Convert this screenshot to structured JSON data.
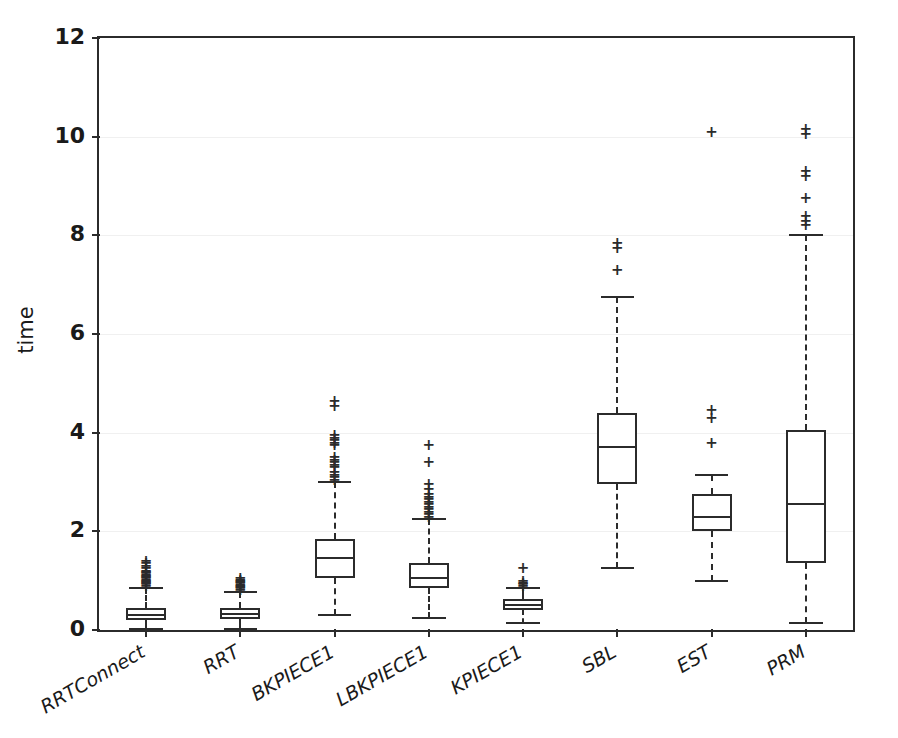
{
  "chart_data": {
    "type": "box",
    "title": "",
    "xlabel": "",
    "ylabel": "time",
    "ylim": [
      0,
      12
    ],
    "yticks": [
      0,
      2,
      4,
      6,
      8,
      10,
      12
    ],
    "grid": true,
    "grid_axis": "y",
    "legend": null,
    "categories": [
      "RRTConnect",
      "RRT",
      "BKPIECE1",
      "LBKPIECE1",
      "KPIECE1",
      "SBL",
      "EST",
      "PRM"
    ],
    "xtick_rotation": -30,
    "boxes": [
      {
        "label": "RRTConnect",
        "whisker_low": 0.02,
        "q1": 0.2,
        "median": 0.3,
        "q3": 0.45,
        "whisker_high": 0.85,
        "fliers": [
          0.9,
          0.93,
          0.95,
          0.98,
          1.0,
          1.02,
          1.05,
          1.07,
          1.1,
          1.12,
          1.15,
          1.18,
          1.2,
          1.25,
          1.3,
          1.35,
          1.4
        ]
      },
      {
        "label": "RRT",
        "whisker_low": 0.03,
        "q1": 0.22,
        "median": 0.32,
        "q3": 0.45,
        "whisker_high": 0.78,
        "fliers": [
          0.82,
          0.85,
          0.88,
          0.9,
          0.92,
          0.95,
          0.97,
          1.0,
          1.02,
          1.05
        ]
      },
      {
        "label": "BKPIECE1",
        "whisker_low": 0.3,
        "q1": 1.05,
        "median": 1.45,
        "q3": 1.85,
        "whisker_high": 3.0,
        "fliers": [
          3.05,
          3.1,
          3.15,
          3.2,
          3.3,
          3.35,
          3.4,
          3.45,
          3.5,
          3.75,
          3.8,
          3.85,
          3.9,
          3.95,
          4.55,
          4.65
        ]
      },
      {
        "label": "LBKPIECE1",
        "whisker_low": 0.25,
        "q1": 0.85,
        "median": 1.05,
        "q3": 1.35,
        "whisker_high": 2.25,
        "fliers": [
          2.3,
          2.35,
          2.4,
          2.45,
          2.5,
          2.55,
          2.6,
          2.65,
          2.7,
          2.75,
          2.85,
          2.95,
          3.4,
          3.75
        ]
      },
      {
        "label": "KPIECE1",
        "whisker_low": 0.15,
        "q1": 0.4,
        "median": 0.5,
        "q3": 0.62,
        "whisker_high": 0.85,
        "fliers": [
          0.9,
          0.93,
          0.96,
          1.0,
          1.25
        ]
      },
      {
        "label": "SBL",
        "whisker_low": 1.25,
        "q1": 2.95,
        "median": 3.7,
        "q3": 4.4,
        "whisker_high": 6.75,
        "fliers": [
          7.3,
          7.75,
          7.85
        ]
      },
      {
        "label": "EST",
        "whisker_low": 1.0,
        "q1": 2.0,
        "median": 2.3,
        "q3": 2.75,
        "whisker_high": 3.15,
        "fliers": [
          3.8,
          4.3,
          4.45,
          10.1
        ]
      },
      {
        "label": "PRM",
        "whisker_low": 0.15,
        "q1": 1.35,
        "median": 2.55,
        "q3": 4.05,
        "whisker_high": 8.0,
        "fliers": [
          8.2,
          8.3,
          8.4,
          8.75,
          9.2,
          9.3,
          10.05,
          10.15
        ]
      }
    ]
  }
}
